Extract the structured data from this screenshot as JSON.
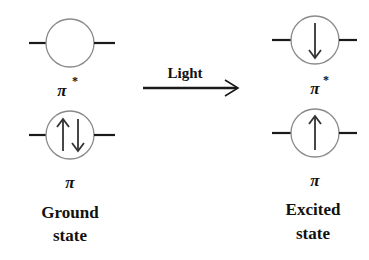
{
  "diagram": {
    "colors": {
      "circle_stroke": "#8a8a8a",
      "line": "#1a1a1a",
      "text": "#111111",
      "arrow": "#1a1a1a"
    },
    "transition": {
      "label": "Light",
      "direction": "left-to-right"
    },
    "ground_state": {
      "title_line1": "Ground",
      "title_line2": "state",
      "orbitals": [
        {
          "name": "π*",
          "symbol": "π",
          "superscript": "*",
          "electrons": []
        },
        {
          "name": "π",
          "symbol": "π",
          "superscript": "",
          "electrons": [
            "up",
            "down"
          ]
        }
      ]
    },
    "excited_state": {
      "title_line1": "Excited",
      "title_line2": "state",
      "orbitals": [
        {
          "name": "π*",
          "symbol": "π",
          "superscript": "*",
          "electrons": [
            "down"
          ]
        },
        {
          "name": "π",
          "symbol": "π",
          "superscript": "",
          "electrons": [
            "up"
          ]
        }
      ]
    }
  }
}
